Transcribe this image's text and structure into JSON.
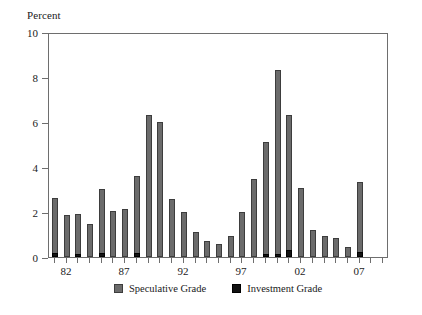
{
  "chart_data": {
    "type": "bar",
    "title": "",
    "subtitle": "",
    "ylabel": "Percent",
    "xlabel": "",
    "ylim": [
      0,
      10
    ],
    "ytick_labels": [
      "0",
      "2",
      "4",
      "6",
      "8",
      "10"
    ],
    "ytick_values": [
      0,
      2,
      4,
      6,
      8,
      10
    ],
    "xtick_labels": [
      "82",
      "87",
      "92",
      "97",
      "02",
      "07"
    ],
    "xtick_values": [
      1982,
      1987,
      1992,
      1997,
      2002,
      2007
    ],
    "xlim": [
      1980.5,
      2009.5
    ],
    "grid": false,
    "stacked": true,
    "legend_position": "bottom-center",
    "categories": [
      1981,
      1982,
      1983,
      1984,
      1985,
      1986,
      1987,
      1988,
      1989,
      1990,
      1991,
      1992,
      1993,
      1994,
      1995,
      1996,
      1997,
      1998,
      1999,
      2000,
      2001,
      2002,
      2003,
      2004,
      2005,
      2006,
      2007,
      2008,
      2009
    ],
    "series": [
      {
        "name": "Speculative Grade",
        "color": "#6b6b6b",
        "values": [
          2.45,
          1.85,
          1.8,
          1.45,
          2.85,
          2.05,
          2.15,
          3.45,
          6.3,
          6.0,
          2.6,
          2.0,
          1.1,
          0.7,
          0.6,
          0.95,
          2.0,
          3.45,
          4.95,
          8.15,
          6.0,
          3.05,
          1.2,
          0.95,
          0.85,
          0.45,
          3.1,
          0.0,
          0.0
        ]
      },
      {
        "name": "Investment Grade",
        "color": "#121212",
        "values": [
          0.18,
          0.0,
          0.1,
          0.0,
          0.18,
          0.0,
          0.0,
          0.16,
          0.0,
          0.0,
          0.0,
          0.0,
          0.0,
          0.0,
          0.0,
          0.0,
          0.0,
          0.0,
          0.15,
          0.15,
          0.32,
          0.0,
          0.0,
          0.0,
          0.0,
          0.0,
          0.24,
          0.0,
          0.0
        ]
      }
    ]
  },
  "legend": {
    "entries": [
      {
        "label": "Speculative Grade",
        "swatch": "gray-square-swatch"
      },
      {
        "label": "Investment Grade",
        "swatch": "black-square-swatch"
      }
    ]
  }
}
